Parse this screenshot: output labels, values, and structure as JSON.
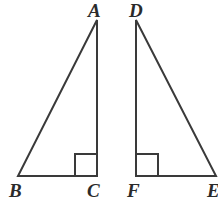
{
  "figure": {
    "background_color": "#ffffff",
    "stroke_color": "#3a3a3a",
    "label_color": "#2b2b2b",
    "stroke_width": 2,
    "canvas": {
      "width": 218,
      "height": 205
    }
  },
  "labels": {
    "a": "A",
    "b": "B",
    "c": "C",
    "d": "D",
    "f": "F",
    "e": "E"
  },
  "shapes": {
    "triangle_abc": {
      "name": "Triangle ABC",
      "vertices": {
        "A": [
          97,
          20
        ],
        "B": [
          18,
          176
        ],
        "C": [
          97,
          176
        ]
      },
      "right_angle_at": "C",
      "right_angle_marker": {
        "x": 75,
        "y": 154,
        "size": 22,
        "opens": "left"
      }
    },
    "triangle_def": {
      "name": "Triangle DEF",
      "vertices": {
        "D": [
          136,
          20
        ],
        "E": [
          216,
          176
        ],
        "F": [
          136,
          176
        ]
      },
      "right_angle_at": "F",
      "right_angle_marker": {
        "x": 136,
        "y": 154,
        "size": 22,
        "opens": "right"
      }
    }
  },
  "label_positions": {
    "a": {
      "left": 88,
      "top": 1
    },
    "d": {
      "left": 129,
      "top": 1
    },
    "b": {
      "left": 9,
      "top": 181
    },
    "c": {
      "left": 87,
      "top": 181
    },
    "f": {
      "left": 127,
      "top": 181
    },
    "e": {
      "left": 207,
      "top": 181
    }
  },
  "chart_data": {
    "type": "diagram",
    "figures": [
      {
        "name": "triangle ABC",
        "points": [
          {
            "label": "A",
            "x": 97,
            "y": 20
          },
          {
            "label": "B",
            "x": 18,
            "y": 176
          },
          {
            "label": "C",
            "x": 97,
            "y": 176
          }
        ],
        "segments": [
          "AB",
          "BC",
          "CA"
        ],
        "right_angle": "C"
      },
      {
        "name": "triangle DEF",
        "points": [
          {
            "label": "D",
            "x": 136,
            "y": 20
          },
          {
            "label": "E",
            "x": 216,
            "y": 176
          },
          {
            "label": "F",
            "x": 136,
            "y": 176
          }
        ],
        "segments": [
          "DE",
          "EF",
          "FD"
        ],
        "right_angle": "F"
      }
    ]
  }
}
